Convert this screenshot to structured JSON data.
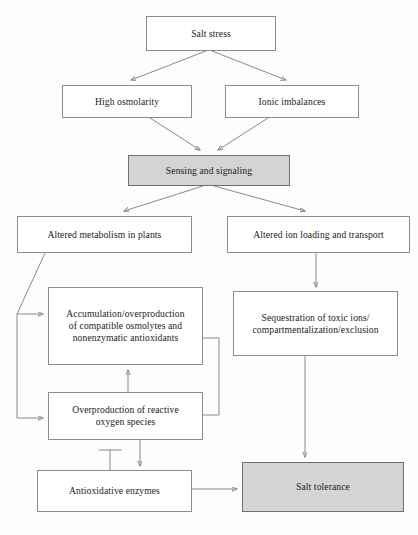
{
  "diagram": {
    "colors": {
      "box_fill": "#ffffff",
      "shaded_fill": "#d4d4d4",
      "border": "#8c8c8c",
      "line": "#7d7d7d",
      "text": "#1b1b1b",
      "background": "#fdfdfd"
    },
    "nodes": [
      {
        "id": "salt-stress",
        "label": "Salt stress",
        "shaded": false,
        "x": 146,
        "y": 16,
        "w": 130,
        "h": 35
      },
      {
        "id": "high-osmolarity",
        "label": "High osmolarity",
        "shaded": false,
        "x": 62,
        "y": 85,
        "w": 130,
        "h": 33
      },
      {
        "id": "ionic-imbalances",
        "label": "Ionic imbalances",
        "shaded": false,
        "x": 225,
        "y": 85,
        "w": 134,
        "h": 33
      },
      {
        "id": "sensing-and-signaling",
        "label": "Sensing and signaling",
        "shaded": true,
        "x": 128,
        "y": 155,
        "w": 162,
        "h": 31
      },
      {
        "id": "altered-metabolism",
        "label": "Altered metabolism in plants",
        "shaded": false,
        "x": 17,
        "y": 216,
        "w": 175,
        "h": 37
      },
      {
        "id": "altered-ion-loading",
        "label": "Altered ion loading and transport",
        "shaded": false,
        "x": 227,
        "y": 216,
        "w": 183,
        "h": 37
      },
      {
        "id": "accumulation-osmolytes",
        "label": "Accumulation/overproduction\nof compatible osmolytes and\nnonenzymatic antioxidants",
        "shaded": false,
        "x": 48,
        "y": 287,
        "w": 155,
        "h": 78
      },
      {
        "id": "sequestration-toxic-ions",
        "label": "Sequestration of toxic ions/\ncompartmentalization/exclusion",
        "shaded": false,
        "x": 233,
        "y": 291,
        "w": 165,
        "h": 65
      },
      {
        "id": "overproduction-ros",
        "label": "Overproduction of reactive\noxygen species",
        "shaded": false,
        "x": 48,
        "y": 392,
        "w": 155,
        "h": 48
      },
      {
        "id": "antioxidative-enzymes",
        "label": "Antioxidative enzymes",
        "shaded": false,
        "x": 37,
        "y": 470,
        "w": 155,
        "h": 42
      },
      {
        "id": "salt-tolerance",
        "label": "Salt tolerance",
        "shaded": true,
        "x": 242,
        "y": 462,
        "w": 162,
        "h": 50
      }
    ],
    "edges": [
      {
        "id": "salt-stress-to-high-osmolarity",
        "kind": "arrow",
        "from": "salt-stress",
        "to": "high-osmolarity"
      },
      {
        "id": "salt-stress-to-ionic-imbalances",
        "kind": "arrow",
        "from": "salt-stress",
        "to": "ionic-imbalances"
      },
      {
        "id": "high-osmolarity-to-sensing",
        "kind": "arrow",
        "from": "high-osmolarity",
        "to": "sensing-and-signaling"
      },
      {
        "id": "ionic-imbalances-to-sensing",
        "kind": "arrow",
        "from": "ionic-imbalances",
        "to": "sensing-and-signaling"
      },
      {
        "id": "sensing-to-altered-metabolism",
        "kind": "arrow",
        "from": "sensing-and-signaling",
        "to": "altered-metabolism"
      },
      {
        "id": "sensing-to-altered-ion-loading",
        "kind": "arrow",
        "from": "sensing-and-signaling",
        "to": "altered-ion-loading"
      },
      {
        "id": "altered-metabolism-to-accumulation",
        "kind": "arrow",
        "from": "altered-metabolism",
        "to": "accumulation-osmolytes"
      },
      {
        "id": "altered-metabolism-to-ros",
        "kind": "arrow",
        "from": "altered-metabolism",
        "to": "overproduction-ros"
      },
      {
        "id": "altered-ion-loading-to-sequestration",
        "kind": "arrow",
        "from": "altered-ion-loading",
        "to": "sequestration-toxic-ions"
      },
      {
        "id": "ros-to-accumulation",
        "kind": "arrow",
        "from": "overproduction-ros",
        "to": "accumulation-osmolytes"
      },
      {
        "id": "ros-to-antioxidative-enzymes",
        "kind": "arrow",
        "from": "overproduction-ros",
        "to": "antioxidative-enzymes"
      },
      {
        "id": "accumulation-inhibits-ros",
        "kind": "inhibition",
        "from": "accumulation-osmolytes",
        "to": "overproduction-ros"
      },
      {
        "id": "antioxidative-enzymes-inhibits-ros",
        "kind": "inhibition",
        "from": "antioxidative-enzymes",
        "to": "overproduction-ros"
      },
      {
        "id": "antioxidative-enzymes-to-salt-tolerance",
        "kind": "arrow",
        "from": "antioxidative-enzymes",
        "to": "salt-tolerance"
      },
      {
        "id": "sequestration-to-salt-tolerance",
        "kind": "arrow",
        "from": "sequestration-toxic-ions",
        "to": "salt-tolerance"
      }
    ]
  }
}
